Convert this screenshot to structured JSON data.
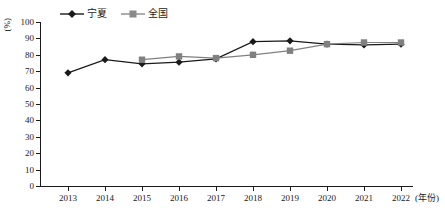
{
  "chart_data": {
    "type": "line",
    "title": "",
    "subtitle": "",
    "xlabel": "(年份)",
    "ylabel": "(%)",
    "categories": [
      "2013",
      "2014",
      "2015",
      "2016",
      "2017",
      "2018",
      "2019",
      "2020",
      "2021",
      "2022"
    ],
    "ylim": [
      0,
      100
    ],
    "yticks": [
      0,
      10,
      20,
      30,
      40,
      50,
      60,
      70,
      80,
      90,
      100
    ],
    "grid": false,
    "legend_position": "top-center",
    "series": [
      {
        "name": "宁夏",
        "color": "#1a1a1a",
        "marker": "diamond",
        "values": [
          69,
          77,
          74.5,
          75.5,
          77.5,
          88,
          88.5,
          86.5,
          86,
          86.5
        ]
      },
      {
        "name": "全国",
        "color": "#808080",
        "marker": "square",
        "values": [
          null,
          null,
          77,
          79,
          78,
          80,
          82.5,
          86.5,
          87.5,
          87.5
        ]
      }
    ]
  },
  "axis": {
    "y_unit_label": "(%)",
    "x_unit_label": "(年份)"
  },
  "legend": {
    "items": [
      {
        "label": "宁夏",
        "marker": "diamond-marker-icon"
      },
      {
        "label": "全国",
        "marker": "square-marker-icon"
      }
    ]
  }
}
